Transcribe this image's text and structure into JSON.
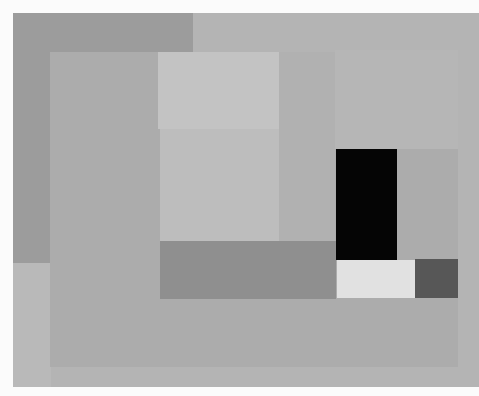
{
  "artwork": {
    "description": "Abstract geometric composition of overlapping grey rectangles with a black block",
    "shapes": [
      {
        "name": "outer-canvas-field",
        "x": 13,
        "y": 13,
        "w": 466,
        "h": 374,
        "color": "#b4b4b4"
      },
      {
        "name": "dark-upper-left-band",
        "x": 13,
        "y": 13,
        "w": 180,
        "h": 250,
        "color": "#9c9c9c"
      },
      {
        "name": "light-lower-left-strip",
        "x": 13,
        "y": 263,
        "w": 38,
        "h": 124,
        "color": "#b9b9b9"
      },
      {
        "name": "inner-frame",
        "x": 50,
        "y": 52,
        "w": 408,
        "h": 315,
        "color": "#acacac"
      },
      {
        "name": "top-light-panel",
        "x": 158,
        "y": 52,
        "w": 121,
        "h": 77,
        "color": "#c3c3c3"
      },
      {
        "name": "middle-light-panel",
        "x": 160,
        "y": 129,
        "w": 119,
        "h": 112,
        "color": "#bdbdbd"
      },
      {
        "name": "right-column-panel",
        "x": 279,
        "y": 52,
        "w": 56,
        "h": 189,
        "color": "#b1b1b1"
      },
      {
        "name": "right-inner-field",
        "x": 335,
        "y": 50,
        "w": 123,
        "h": 99,
        "color": "#b6b6b6"
      },
      {
        "name": "dark-horizontal-bar",
        "x": 160,
        "y": 241,
        "w": 176,
        "h": 58,
        "color": "#8f8f8f"
      },
      {
        "name": "black-block",
        "x": 336,
        "y": 149,
        "w": 61,
        "h": 111,
        "color": "#050505"
      },
      {
        "name": "white-block",
        "x": 337,
        "y": 260,
        "w": 78,
        "h": 38,
        "color": "#e1e1e1"
      },
      {
        "name": "charcoal-block",
        "x": 415,
        "y": 259,
        "w": 43,
        "h": 39,
        "color": "#575757"
      }
    ]
  }
}
